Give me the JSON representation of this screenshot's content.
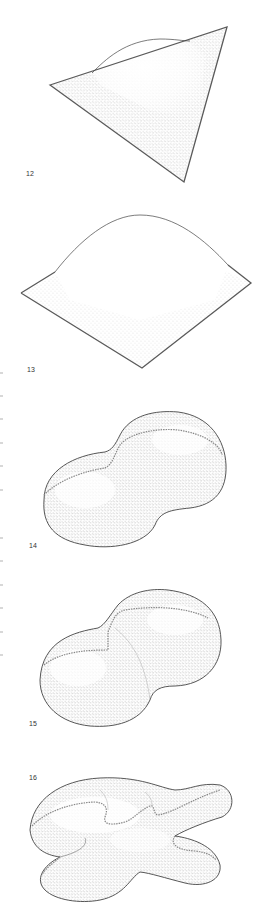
{
  "figures": [
    {
      "number": "12",
      "shape": "triangular membrane with raised dome",
      "label_x": 26,
      "label_y": 175
    },
    {
      "number": "13",
      "shape": "square membrane with raised dome",
      "label_x": 27,
      "label_y": 362
    },
    {
      "number": "14",
      "shape": "peanut-shaped inflated surface with dashed seam",
      "label_x": 29,
      "label_y": 543
    },
    {
      "number": "15",
      "shape": "double-bubble inflated surface with dashed seams",
      "label_x": 29,
      "label_y": 720
    },
    {
      "number": "16",
      "shape": "multi-lobed inflated surface with dashed seams",
      "label_x": 29,
      "label_y": 774
    }
  ],
  "colors": {
    "outline": "#4a4a4a",
    "stipple": "#7a7a7a",
    "seam": "#888888",
    "background": "#ffffff"
  }
}
